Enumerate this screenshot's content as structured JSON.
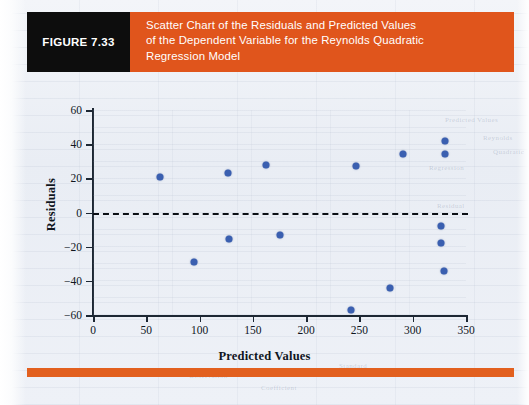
{
  "figure": {
    "tag": "FIGURE 7.33",
    "caption_lines": [
      "Scatter Chart of the Residuals and Predicted Values",
      "of the Dependent Variable for the Reynolds Quadratic",
      "Regression Model"
    ],
    "tag_bg": "#0d0d0d",
    "caption_bg": "#e0551c",
    "rule_color": "#e2601f"
  },
  "chart_data": {
    "type": "scatter",
    "title": "Scatter Chart of the Residuals and Predicted Values of the Dependent Variable for the Reynolds Quadratic Regression Model",
    "xlabel": "Predicted Values",
    "ylabel": "Residuals",
    "xlim": [
      0,
      350
    ],
    "ylim": [
      -60,
      60
    ],
    "xticks": [
      0,
      50,
      100,
      150,
      200,
      250,
      300,
      350
    ],
    "yticks": [
      -60,
      -40,
      -20,
      0,
      20,
      40,
      60
    ],
    "grid": false,
    "legend": null,
    "marker_color": "#3a5fb0",
    "reference_line": {
      "y": 0,
      "style": "dashed",
      "color": "#0b0f15"
    },
    "points": [
      {
        "x": 63,
        "y": 21
      },
      {
        "x": 95,
        "y": -29
      },
      {
        "x": 127,
        "y": 23
      },
      {
        "x": 128,
        "y": -15.5
      },
      {
        "x": 162,
        "y": 28
      },
      {
        "x": 175,
        "y": -13
      },
      {
        "x": 242,
        "y": -57
      },
      {
        "x": 247,
        "y": 27
      },
      {
        "x": 279,
        "y": -44
      },
      {
        "x": 291,
        "y": 34
      },
      {
        "x": 327,
        "y": -8
      },
      {
        "x": 327,
        "y": -18
      },
      {
        "x": 329,
        "y": -34
      },
      {
        "x": 330,
        "y": 42
      },
      {
        "x": 330,
        "y": 34
      }
    ]
  },
  "ghost_text": [
    {
      "t": "Predicted Values",
      "x": 352,
      "y": 6
    },
    {
      "t": "Reynolds",
      "x": 390,
      "y": 24
    },
    {
      "t": "Quadratic",
      "x": 400,
      "y": 38
    },
    {
      "t": "Regression",
      "x": 336,
      "y": 54
    },
    {
      "t": "Residual",
      "x": 344,
      "y": 92
    },
    {
      "t": "Standard",
      "x": 246,
      "y": 252
    },
    {
      "t": "Deviation",
      "x": 318,
      "y": 258
    },
    {
      "t": "Observation",
      "x": 96,
      "y": 262
    },
    {
      "t": "Coefficient",
      "x": 168,
      "y": 274
    }
  ]
}
